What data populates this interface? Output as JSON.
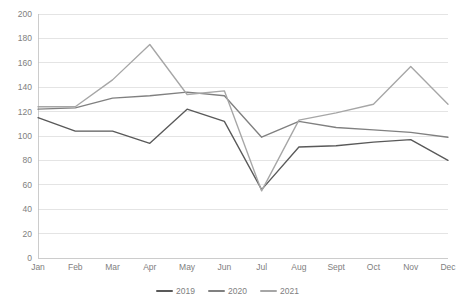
{
  "chart_data": {
    "type": "line",
    "title": "",
    "subtitle": "",
    "xlabel": "",
    "ylabel": "",
    "categories": [
      "Jan",
      "Feb",
      "Mar",
      "Apr",
      "May",
      "Jun",
      "Jul",
      "Aug",
      "Sept",
      "Oct",
      "Nov",
      "Dec"
    ],
    "ylim": [
      0,
      200
    ],
    "yticks": [
      0,
      20,
      40,
      60,
      80,
      100,
      120,
      140,
      160,
      180,
      200
    ],
    "ytick_labels": [
      "0",
      "20",
      "40",
      "60",
      "80",
      "100",
      "120",
      "140",
      "160",
      "180",
      "200"
    ],
    "grid": true,
    "legend_position": "bottom",
    "series": [
      {
        "name": "2019",
        "color": "#595959",
        "values": [
          115,
          104,
          104,
          94,
          122,
          112,
          56,
          91,
          92,
          95,
          97,
          80
        ]
      },
      {
        "name": "2020",
        "color": "#808080",
        "values": [
          122,
          123,
          131,
          133,
          136,
          133,
          99,
          112,
          107,
          105,
          103,
          99
        ]
      },
      {
        "name": "2021",
        "color": "#a6a6a6",
        "values": [
          124,
          124,
          146,
          175,
          134,
          137,
          55,
          113,
          119,
          126,
          157,
          126
        ]
      }
    ]
  },
  "legend": {
    "items": [
      {
        "label": "2019",
        "color": "#595959"
      },
      {
        "label": "2020",
        "color": "#808080"
      },
      {
        "label": "2021",
        "color": "#a6a6a6"
      }
    ]
  },
  "axes": {
    "grid_color": "#d9d9d9",
    "tick_label_color": "#808080"
  }
}
